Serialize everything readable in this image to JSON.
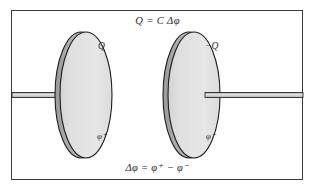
{
  "figure": {
    "equations": {
      "top": "Q = C Δφ",
      "bottom": "Δφ = φ⁺ − φ⁻"
    },
    "plates": [
      {
        "id": "left-plate",
        "charge_label": "Q",
        "potential_label": "φ⁺",
        "potential_base": "φ",
        "potential_sign": "+",
        "center_x": 85,
        "center_y": 95,
        "radius_x": 26,
        "radius_y": 63,
        "face_color": "#e2e2e2",
        "rim_color": "#b4b4b4",
        "outline_color": "#1c1c1c"
      },
      {
        "id": "right-plate",
        "charge_label": "−Q",
        "potential_label": "φ⁻",
        "potential_base": "φ",
        "potential_sign": "−",
        "center_x": 193,
        "center_y": 95,
        "radius_x": 26,
        "radius_y": 63,
        "face_color": "#e2e2e2",
        "rim_color": "#b4b4b4",
        "outline_color": "#1c1c1c"
      }
    ],
    "wires": [
      {
        "id": "left-wire",
        "x_start": 12,
        "x_end": 62,
        "y": 95,
        "thickness": 5,
        "fill_color": "#d6d6d6",
        "edge_color": "#2b2b2b"
      },
      {
        "id": "right-wire",
        "x_start": 205,
        "x_end": 303,
        "y": 95,
        "thickness": 5,
        "fill_color": "#d6d6d6",
        "edge_color": "#2b2b2b"
      }
    ],
    "frame": {
      "border_color": "#3a3a3a",
      "background": "#ffffff"
    },
    "colors": {
      "plate_face": "#e2e2e2",
      "plate_rim": "#b4b4b4",
      "outline": "#1c1c1c",
      "text": "#2a2a2a",
      "page_background": "#ffffff"
    }
  }
}
